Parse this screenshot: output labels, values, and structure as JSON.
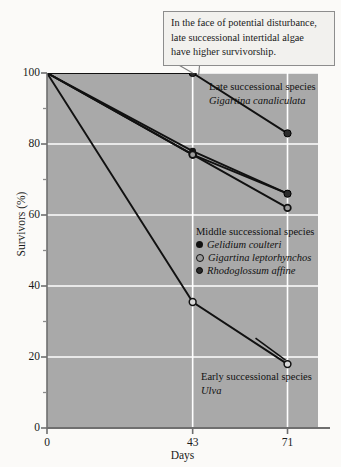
{
  "callout": {
    "lines": [
      "In the face of potential disturbance,",
      "late successional intertidal algae",
      "have higher survivorship."
    ]
  },
  "annotations": {
    "late": {
      "title": "Late successional species",
      "species": "Gigartina canaliculata"
    },
    "middle": {
      "title": "Middle successional species"
    },
    "early": {
      "title": "Early successional species",
      "species": "Ulva"
    }
  },
  "legend": {
    "items": [
      {
        "label": "Gelidium coulteri",
        "marker": "solid-circle"
      },
      {
        "label": "Gigartina leptorhynchos",
        "marker": "ring-circle"
      },
      {
        "label": "Rhodoglossum affine",
        "marker": "dark-circle"
      }
    ]
  },
  "chart_data": {
    "type": "line",
    "title": "",
    "xlabel": "Days",
    "ylabel": "Survivors (%)",
    "xlim": [
      0,
      80
    ],
    "ylim": [
      0,
      100
    ],
    "xticks": [
      0,
      43,
      71
    ],
    "xtick_labels": [
      "0",
      "43",
      "71"
    ],
    "yticks": [
      0,
      20,
      40,
      60,
      80,
      100
    ],
    "ytick_labels": [
      "0",
      "20",
      "40",
      "60",
      "80",
      "100"
    ],
    "yminorticks": [
      10,
      30,
      50,
      70,
      90
    ],
    "grid": true,
    "grid_color": "#ffffff",
    "plot_bg": "#a9a9a9",
    "legend_position": "inside-right",
    "x": [
      0,
      43,
      71
    ],
    "series": [
      {
        "name": "Gigartina canaliculata",
        "group": "late",
        "values": [
          100,
          100,
          83
        ],
        "marker": "dark-circle",
        "color": "#111111"
      },
      {
        "name": "Gelidium coulteri",
        "group": "middle",
        "values": [
          100,
          78,
          66
        ],
        "marker": "solid-circle",
        "color": "#111111"
      },
      {
        "name": "Rhodoglossum affine",
        "group": "middle",
        "values": [
          100,
          77,
          66
        ],
        "marker": "dark-circle",
        "color": "#111111"
      },
      {
        "name": "Gigartina leptorhynchos",
        "group": "middle",
        "values": [
          100,
          77,
          62
        ],
        "marker": "ring-circle",
        "color": "#111111"
      },
      {
        "name": "Ulva",
        "group": "early",
        "values": [
          100,
          35.5,
          18
        ],
        "marker": "open-circle",
        "color": "#111111"
      }
    ]
  }
}
